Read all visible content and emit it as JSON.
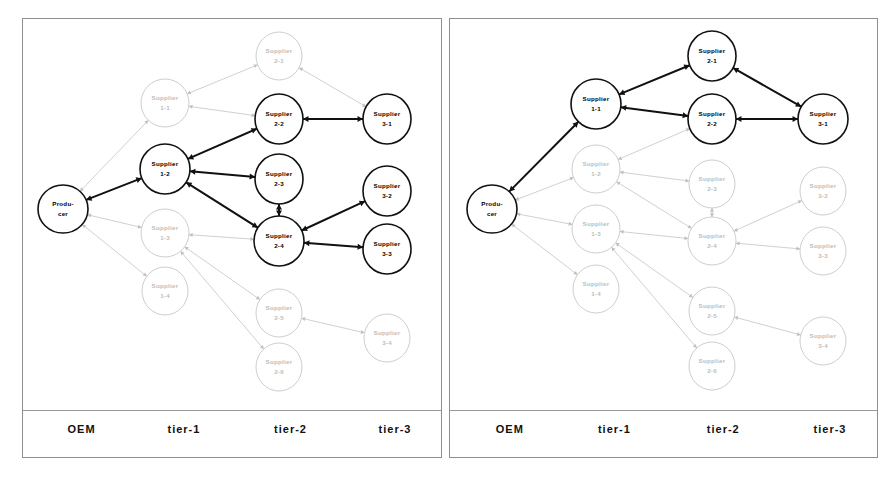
{
  "figure": {
    "type": "diagram",
    "panel_count": 2
  },
  "axis": {
    "labels": [
      {
        "text": "OEM",
        "x_pct": 14.0
      },
      {
        "text": "tier-1",
        "x_pct": 38.5
      },
      {
        "text": "tier-2",
        "x_pct": 64.0
      },
      {
        "text": "tier-3",
        "x_pct": 89.0
      }
    ]
  },
  "colors": {
    "active_stroke": "#111111",
    "faded_stroke": "#c0c0c0",
    "active_text": "#000000",
    "faded_text": "#bdbdbd",
    "panel_border": "#8e8e8e",
    "background": "#ffffff"
  },
  "panels": [
    {
      "id": "panel-left",
      "name": "left-network-diagram",
      "nodes": [
        {
          "id": "producer",
          "line1": "Produ-",
          "line2": "cer",
          "x": 40,
          "y": 190,
          "rx": 25,
          "ry": 24,
          "state": "active"
        },
        {
          "id": "s1-1",
          "line1": "Supplier",
          "line2": "1-1",
          "x": 142,
          "y": 84,
          "rx": 24,
          "ry": 24,
          "state": "faded"
        },
        {
          "id": "s1-2",
          "line1": "Supplier",
          "line2": "1-2",
          "x": 142,
          "y": 150,
          "rx": 25,
          "ry": 25,
          "state": "active"
        },
        {
          "id": "s1-3",
          "line1": "Supplier",
          "line2": "1-3",
          "x": 142,
          "y": 214,
          "rx": 24,
          "ry": 24,
          "state": "faded"
        },
        {
          "id": "s1-4",
          "line1": "Supplier",
          "line2": "1-4",
          "x": 142,
          "y": 272,
          "rx": 23,
          "ry": 24,
          "state": "faded"
        },
        {
          "id": "s2-1",
          "line1": "Supplier",
          "line2": "2-1",
          "x": 256,
          "y": 37,
          "rx": 23,
          "ry": 24,
          "state": "faded"
        },
        {
          "id": "s2-2",
          "line1": "Supplier",
          "line2": "2-2",
          "x": 256,
          "y": 100,
          "rx": 24,
          "ry": 25,
          "state": "active"
        },
        {
          "id": "s2-3",
          "line1": "Supplier",
          "line2": "2-3",
          "x": 256,
          "y": 160,
          "rx": 24,
          "ry": 25,
          "state": "active"
        },
        {
          "id": "s2-4",
          "line1": "Supplier",
          "line2": "2-4",
          "x": 256,
          "y": 222,
          "rx": 25,
          "ry": 25,
          "state": "active"
        },
        {
          "id": "s2-5",
          "line1": "Supplier",
          "line2": "2-5",
          "x": 256,
          "y": 294,
          "rx": 23,
          "ry": 24,
          "state": "faded"
        },
        {
          "id": "s2-6",
          "line1": "Supplier",
          "line2": "2-6",
          "x": 256,
          "y": 348,
          "rx": 23,
          "ry": 24,
          "state": "faded"
        },
        {
          "id": "s3-1",
          "line1": "Supplier",
          "line2": "3-1",
          "x": 364,
          "y": 100,
          "rx": 24,
          "ry": 25,
          "state": "active"
        },
        {
          "id": "s3-2",
          "line1": "Supplier",
          "line2": "3-2",
          "x": 364,
          "y": 172,
          "rx": 24,
          "ry": 25,
          "state": "active"
        },
        {
          "id": "s3-3",
          "line1": "Supplier",
          "line2": "3-3",
          "x": 364,
          "y": 230,
          "rx": 24,
          "ry": 25,
          "state": "active"
        },
        {
          "id": "s3-4",
          "line1": "Supplier",
          "line2": "3-4",
          "x": 364,
          "y": 319,
          "rx": 23,
          "ry": 24,
          "state": "faded"
        }
      ],
      "edges": [
        {
          "from": "s1-1",
          "to": "producer",
          "state": "faded",
          "bidir": true
        },
        {
          "from": "s1-2",
          "to": "producer",
          "state": "active",
          "bidir": true
        },
        {
          "from": "s1-3",
          "to": "producer",
          "state": "faded",
          "bidir": true
        },
        {
          "from": "s1-4",
          "to": "producer",
          "state": "faded",
          "bidir": true
        },
        {
          "from": "s2-1",
          "to": "s1-1",
          "state": "faded",
          "bidir": true
        },
        {
          "from": "s2-2",
          "to": "s1-1",
          "state": "faded",
          "bidir": true
        },
        {
          "from": "s2-2",
          "to": "s1-2",
          "state": "active",
          "bidir": true
        },
        {
          "from": "s2-3",
          "to": "s1-2",
          "state": "active",
          "bidir": true
        },
        {
          "from": "s2-4",
          "to": "s1-2",
          "state": "active",
          "bidir": true
        },
        {
          "from": "s2-4",
          "to": "s1-3",
          "state": "faded",
          "bidir": true
        },
        {
          "from": "s2-5",
          "to": "s1-3",
          "state": "faded",
          "bidir": true
        },
        {
          "from": "s2-6",
          "to": "s1-3",
          "state": "faded",
          "bidir": true
        },
        {
          "from": "s2-4",
          "to": "s2-3",
          "state": "active",
          "bidir": true
        },
        {
          "from": "s3-1",
          "to": "s2-1",
          "state": "faded",
          "bidir": true
        },
        {
          "from": "s3-1",
          "to": "s2-2",
          "state": "active",
          "bidir": true
        },
        {
          "from": "s3-2",
          "to": "s2-4",
          "state": "active",
          "bidir": true
        },
        {
          "from": "s3-3",
          "to": "s2-4",
          "state": "active",
          "bidir": true
        },
        {
          "from": "s3-4",
          "to": "s2-5",
          "state": "faded",
          "bidir": true
        }
      ]
    },
    {
      "id": "panel-right",
      "name": "right-network-diagram",
      "nodes": [
        {
          "id": "producer",
          "line1": "Produ-",
          "line2": "cer",
          "x": 42,
          "y": 190,
          "rx": 25,
          "ry": 24,
          "state": "active"
        },
        {
          "id": "s1-1",
          "line1": "Supplier",
          "line2": "1-1",
          "x": 146,
          "y": 85,
          "rx": 25,
          "ry": 25,
          "state": "active"
        },
        {
          "id": "s1-2",
          "line1": "Supplier",
          "line2": "1-2",
          "x": 146,
          "y": 150,
          "rx": 24,
          "ry": 24,
          "state": "faded"
        },
        {
          "id": "s1-3",
          "line1": "Supplier",
          "line2": "1-3",
          "x": 146,
          "y": 210,
          "rx": 24,
          "ry": 24,
          "state": "faded"
        },
        {
          "id": "s1-4",
          "line1": "Supplier",
          "line2": "1-4",
          "x": 146,
          "y": 270,
          "rx": 23,
          "ry": 24,
          "state": "faded"
        },
        {
          "id": "s2-1",
          "line1": "Supplier",
          "line2": "2-1",
          "x": 262,
          "y": 37,
          "rx": 24,
          "ry": 25,
          "state": "active"
        },
        {
          "id": "s2-2",
          "line1": "Supplier",
          "line2": "2-2",
          "x": 262,
          "y": 100,
          "rx": 24,
          "ry": 25,
          "state": "active"
        },
        {
          "id": "s2-3",
          "line1": "Supplier",
          "line2": "2-3",
          "x": 262,
          "y": 165,
          "rx": 23,
          "ry": 24,
          "state": "faded"
        },
        {
          "id": "s2-4",
          "line1": "Supplier",
          "line2": "2-4",
          "x": 262,
          "y": 222,
          "rx": 24,
          "ry": 24,
          "state": "faded"
        },
        {
          "id": "s2-5",
          "line1": "Supplier",
          "line2": "2-5",
          "x": 262,
          "y": 292,
          "rx": 23,
          "ry": 24,
          "state": "faded"
        },
        {
          "id": "s2-6",
          "line1": "Supplier",
          "line2": "2-6",
          "x": 262,
          "y": 347,
          "rx": 23,
          "ry": 24,
          "state": "faded"
        },
        {
          "id": "s3-1",
          "line1": "Supplier",
          "line2": "3-1",
          "x": 373,
          "y": 100,
          "rx": 25,
          "ry": 25,
          "state": "active"
        },
        {
          "id": "s3-2",
          "line1": "Supplier",
          "line2": "3-2",
          "x": 373,
          "y": 172,
          "rx": 23,
          "ry": 24,
          "state": "faded"
        },
        {
          "id": "s3-3",
          "line1": "Supplier",
          "line2": "3-3",
          "x": 373,
          "y": 232,
          "rx": 23,
          "ry": 24,
          "state": "faded"
        },
        {
          "id": "s3-4",
          "line1": "Supplier",
          "line2": "3-4",
          "x": 373,
          "y": 322,
          "rx": 23,
          "ry": 24,
          "state": "faded"
        }
      ],
      "edges": [
        {
          "from": "s1-1",
          "to": "producer",
          "state": "active",
          "bidir": true
        },
        {
          "from": "s1-2",
          "to": "producer",
          "state": "faded",
          "bidir": true
        },
        {
          "from": "s1-3",
          "to": "producer",
          "state": "faded",
          "bidir": true
        },
        {
          "from": "s1-4",
          "to": "producer",
          "state": "faded",
          "bidir": true
        },
        {
          "from": "s2-1",
          "to": "s1-1",
          "state": "active",
          "bidir": true
        },
        {
          "from": "s2-2",
          "to": "s1-1",
          "state": "active",
          "bidir": true
        },
        {
          "from": "s2-2",
          "to": "s1-2",
          "state": "faded",
          "bidir": true
        },
        {
          "from": "s2-3",
          "to": "s1-2",
          "state": "faded",
          "bidir": true
        },
        {
          "from": "s2-4",
          "to": "s1-2",
          "state": "faded",
          "bidir": true
        },
        {
          "from": "s2-4",
          "to": "s1-3",
          "state": "faded",
          "bidir": true
        },
        {
          "from": "s2-5",
          "to": "s1-3",
          "state": "faded",
          "bidir": true
        },
        {
          "from": "s2-6",
          "to": "s1-3",
          "state": "faded",
          "bidir": true
        },
        {
          "from": "s2-4",
          "to": "s2-3",
          "state": "faded",
          "bidir": true
        },
        {
          "from": "s3-1",
          "to": "s2-1",
          "state": "active",
          "bidir": true
        },
        {
          "from": "s3-1",
          "to": "s2-2",
          "state": "active",
          "bidir": true
        },
        {
          "from": "s3-2",
          "to": "s2-4",
          "state": "faded",
          "bidir": true
        },
        {
          "from": "s3-3",
          "to": "s2-4",
          "state": "faded",
          "bidir": true
        },
        {
          "from": "s3-4",
          "to": "s2-5",
          "state": "faded",
          "bidir": true
        }
      ]
    }
  ]
}
